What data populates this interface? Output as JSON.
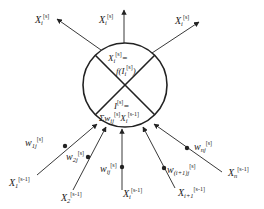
{
  "diagram": {
    "type": "neuron-model",
    "colors": {
      "stroke": "#222222",
      "background": "#ffffff"
    },
    "neuron": {
      "output_formula": {
        "lhs": "X",
        "lhs_sub": "i",
        "lhs_sup": "[s]",
        "eq": "=",
        "f": "f(I",
        "f_sub": "i",
        "f_sup": "[s]",
        "close": ")"
      },
      "input_formula": {
        "lhs": "I",
        "lhs_sup": "[s]",
        "eq": "=",
        "sum": "Σw",
        "sum_sub": "ij",
        "sum_sup": "[s]",
        "x": "X",
        "x_sub": "i",
        "x_sup": "[s-1]"
      }
    },
    "outputs": [
      {
        "name": "X",
        "sub": "i",
        "sup": "[s]"
      },
      {
        "name": "X",
        "sub": "i",
        "sup": "[s]"
      },
      {
        "name": "X",
        "sub": "i",
        "sup": "[s]"
      }
    ],
    "inputs": [
      {
        "name": "X",
        "sub": "1",
        "sup": "[s-1]",
        "weight": "w",
        "weight_sub": "1j",
        "weight_sup": "[s]"
      },
      {
        "name": "X",
        "sub": "2",
        "sup": "[s-1]",
        "weight": "w",
        "weight_sub": "2j",
        "weight_sup": "[s]"
      },
      {
        "name": "X",
        "sub": "i",
        "sup": "[s-1]",
        "weight": "w",
        "weight_sub": "ij",
        "weight_sup": "[s]"
      },
      {
        "name": "X",
        "sub": "i+1",
        "sup": "[s-1]",
        "weight": "w",
        "weight_sub": "(i+1)j",
        "weight_sup": "[s]"
      },
      {
        "name": "X",
        "sub": "n",
        "sup": "[s-1]",
        "weight": "w",
        "weight_sub": "nj",
        "weight_sup": "[s]"
      }
    ]
  }
}
